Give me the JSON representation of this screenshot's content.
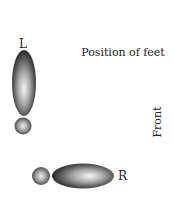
{
  "diagram": {
    "title": "Position of feet",
    "orientation_label": "Front",
    "left_foot": {
      "label": "L"
    },
    "right_foot": {
      "label": "R"
    }
  },
  "colors": {
    "background": "#ffffff",
    "shade_light": "#f2f2f2",
    "shade_mid": "#9a9a9a",
    "shade_dark": "#2a2a2a",
    "text": "#222222"
  }
}
